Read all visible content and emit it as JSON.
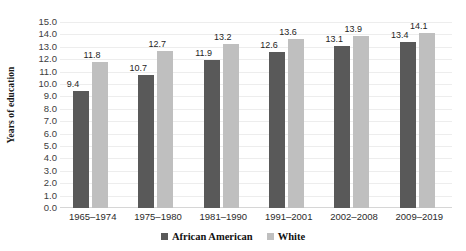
{
  "chart_data": {
    "type": "bar",
    "title": "",
    "xlabel": "",
    "ylabel": "Years of education",
    "ylim": [
      0,
      15
    ],
    "ytick_step": 1,
    "ytick_labels": [
      "15.0",
      "14.0",
      "13.0",
      "12.0",
      "11.0",
      "10.0",
      "9.0",
      "8.0",
      "7.0",
      "6.0",
      "5.0",
      "4.0",
      "3.0",
      "2.0",
      "1.0",
      "0.0"
    ],
    "grid": true,
    "legend_position": "bottom-center",
    "categories": [
      "1965–1974",
      "1975–1980",
      "1981–1990",
      "1991–2001",
      "2002–2008",
      "2009–2019"
    ],
    "series": [
      {
        "name": "African American",
        "color": "#595959",
        "values": [
          9.4,
          10.7,
          11.9,
          12.6,
          13.1,
          13.4
        ],
        "labels": [
          "9.4",
          "10.7",
          "11.9",
          "12.6",
          "13.1",
          "13.4"
        ]
      },
      {
        "name": "White",
        "color": "#bfbfbf",
        "values": [
          11.8,
          12.7,
          13.2,
          13.6,
          13.9,
          14.1
        ],
        "labels": [
          "11.8",
          "12.7",
          "13.2",
          "13.6",
          "13.9",
          "14.1"
        ]
      }
    ]
  },
  "colors": {
    "series_dark": "#595959",
    "series_light": "#bfbfbf",
    "gridline": "#ededed",
    "background": "#ffffff",
    "text": "#1f1f1f"
  }
}
